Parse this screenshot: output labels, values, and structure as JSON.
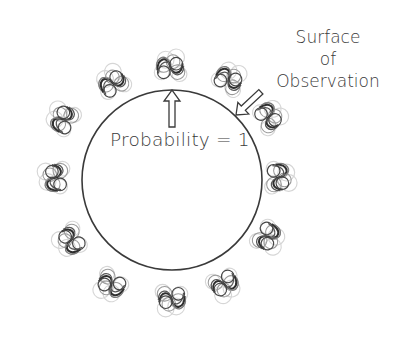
{
  "diagram": {
    "title": "",
    "labels": {
      "probability": "Probability = 1",
      "surface": [
        "Surface",
        "of",
        "Observation"
      ]
    },
    "circle": {
      "cx": 172,
      "cy": 180,
      "r": 90,
      "stroke": "#3a3a3a"
    },
    "arrows": [
      {
        "name": "probability-arrow",
        "from": "label-probability",
        "to": "circle-top",
        "direction": "up"
      },
      {
        "name": "surface-arrow",
        "from": "label-surface",
        "to": "circle-upper-right",
        "direction": "down-left"
      }
    ],
    "swirls": {
      "count": 12,
      "description": "wave-function squiggle glyphs arranged around the circle",
      "positions": [
        {
          "x": 170,
          "y": 68
        },
        {
          "x": 228,
          "y": 80
        },
        {
          "x": 268,
          "y": 117
        },
        {
          "x": 278,
          "y": 177
        },
        {
          "x": 267,
          "y": 236
        },
        {
          "x": 224,
          "y": 283
        },
        {
          "x": 172,
          "y": 298
        },
        {
          "x": 112,
          "y": 284
        },
        {
          "x": 72,
          "y": 240
        },
        {
          "x": 56,
          "y": 178
        },
        {
          "x": 64,
          "y": 120
        },
        {
          "x": 113,
          "y": 84
        }
      ]
    },
    "colors": {
      "ink": "#3a3a3a",
      "ghost": "#c8c8c8",
      "background": "#ffffff"
    }
  }
}
